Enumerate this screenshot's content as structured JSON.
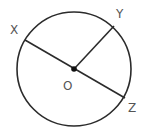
{
  "diagram": {
    "type": "circle-with-radii",
    "colors": {
      "stroke": "#2b2b2b",
      "label": "#555555",
      "background": "#ffffff"
    },
    "circle": {
      "cx": 74,
      "cy": 69,
      "r": 57
    },
    "center_point": {
      "label": "O",
      "x": 74,
      "y": 69
    },
    "points": [
      {
        "label": "X",
        "x": 25,
        "y": 40
      },
      {
        "label": "Y",
        "x": 114,
        "y": 26
      },
      {
        "label": "Z",
        "x": 125,
        "y": 98
      }
    ],
    "segments": [
      {
        "name": "XZ",
        "type": "diameter",
        "from": "X",
        "to": "Z"
      },
      {
        "name": "OY",
        "type": "radius",
        "from": "O",
        "to": "Y"
      }
    ],
    "labels": {
      "x": "X",
      "y": "Y",
      "z": "Z",
      "o": "O"
    }
  }
}
